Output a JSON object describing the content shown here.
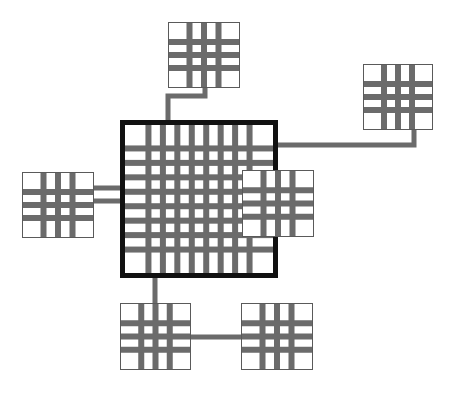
{
  "diagram": {
    "canvas": {
      "width": 456,
      "height": 397,
      "background": "#ffffff"
    },
    "style": {
      "grid_bar_color": "#6b6b6b",
      "connector_color": "#6b6b6b",
      "node_border_color": "#5a5a5a",
      "main_border_color": "#111111",
      "node_fill": "#ffffff",
      "main_fill": "#ffffff",
      "node_border_width": 1,
      "main_border_width": 5,
      "connector_width": 5
    },
    "nodes": [
      {
        "id": "node-top",
        "label": "top-grid-cell",
        "x": 168,
        "y": 22,
        "width": 72,
        "height": 66,
        "grid": {
          "cols": 3,
          "rows": 3,
          "bar": 6
        }
      },
      {
        "id": "node-top-right",
        "label": "top-right-grid-cell",
        "x": 363,
        "y": 64,
        "width": 70,
        "height": 66,
        "grid": {
          "cols": 3,
          "rows": 3,
          "bar": 6
        }
      },
      {
        "id": "node-left",
        "label": "left-grid-cell",
        "x": 22,
        "y": 172,
        "width": 72,
        "height": 66,
        "grid": {
          "cols": 3,
          "rows": 3,
          "bar": 6
        }
      },
      {
        "id": "node-right",
        "label": "right-grid-cell",
        "x": 242,
        "y": 170,
        "width": 72,
        "height": 67,
        "grid": {
          "cols": 3,
          "rows": 3,
          "bar": 6
        }
      },
      {
        "id": "node-bottom-left",
        "label": "bottom-left-grid-cell",
        "x": 120,
        "y": 303,
        "width": 71,
        "height": 67,
        "grid": {
          "cols": 3,
          "rows": 3,
          "bar": 6
        }
      },
      {
        "id": "node-bottom-right",
        "label": "bottom-right-grid-cell",
        "x": 241,
        "y": 303,
        "width": 72,
        "height": 67,
        "grid": {
          "cols": 3,
          "rows": 3,
          "bar": 6
        }
      }
    ],
    "main_node": {
      "id": "node-main",
      "label": "main-grid-container",
      "x": 120,
      "y": 120,
      "width": 158,
      "height": 158,
      "grid": {
        "cols": 8,
        "rows": 8,
        "bar": 6
      }
    },
    "connectors": [
      {
        "id": "connector-top",
        "label": "top-node-to-main",
        "from": "node-top",
        "to": "node-main",
        "points": "205,60 205,96 168,96 168,160"
      },
      {
        "id": "connector-top-right",
        "label": "top-right-node-to-main",
        "from": "node-top-right",
        "to": "node-main",
        "points": "414,100 414,145 140,145"
      },
      {
        "id": "connector-left-upper",
        "label": "left-node-to-main-upper",
        "from": "node-left",
        "to": "node-main",
        "points": "60,188 210,188"
      },
      {
        "id": "connector-left-lower",
        "label": "left-node-to-main-lower",
        "from": "node-left",
        "to": "node-main",
        "points": "60,201 210,201"
      },
      {
        "id": "connector-bottom",
        "label": "main-to-bottom-left-node",
        "from": "node-main",
        "to": "node-bottom-left",
        "points": "155,200 155,340"
      },
      {
        "id": "connector-bottom-pair",
        "label": "bottom-left-to-bottom-right",
        "from": "node-bottom-left",
        "to": "node-bottom-right",
        "points": "160,337 295,337"
      }
    ]
  }
}
